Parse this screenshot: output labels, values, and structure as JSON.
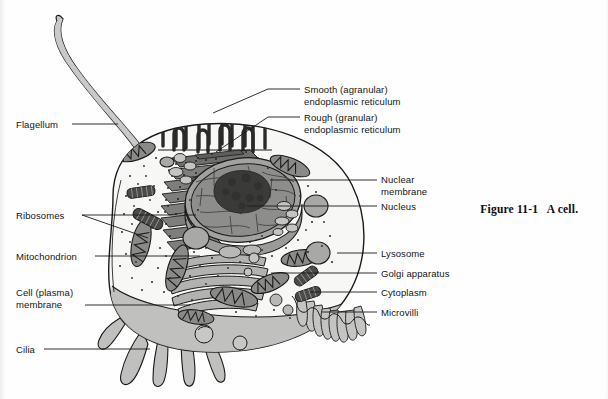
{
  "figure": {
    "number": "Figure 11-1",
    "title": "A cell.",
    "caption_x": 468,
    "caption_y": 191
  },
  "colors": {
    "outline": "#1a1a1a",
    "cytoplasm_fill": "#f7f7f5",
    "membrane_shadow": "#b9b9b7",
    "organelle_mid": "#9a9a98",
    "organelle_dark": "#5e5e5c",
    "nucleolus": "#3b3b3a",
    "nucleus_fill": "#8e8e8c",
    "page_background": "#fefefe"
  },
  "labels": [
    {
      "id": "flagellum",
      "name": "Flagellum",
      "lines": [
        "Flagellum"
      ],
      "side": "left",
      "text_x": 16,
      "text_y": 119,
      "leader": [
        [
          72,
          124
        ],
        [
          118,
          124
        ]
      ]
    },
    {
      "id": "ribosomes",
      "name": "Ribosomes",
      "lines": [
        "Ribosomes"
      ],
      "side": "left",
      "text_x": 16,
      "text_y": 210,
      "leader": [
        [
          82,
          215
        ],
        [
          196,
          215
        ]
      ],
      "leader2": [
        [
          82,
          215
        ],
        [
          148,
          238
        ]
      ]
    },
    {
      "id": "mitochondrion",
      "name": "Mitochondrion",
      "lines": [
        "Mitochondrion"
      ],
      "side": "left",
      "text_x": 16,
      "text_y": 251,
      "leader": [
        [
          95,
          256
        ],
        [
          200,
          256
        ]
      ]
    },
    {
      "id": "cell-plasma-membrane",
      "name": "Cell (plasma) membrane",
      "lines": [
        "Cell (plasma)",
        "membrane"
      ],
      "side": "left",
      "text_x": 16,
      "text_y": 287,
      "leader": [
        [
          85,
          305
        ],
        [
          190,
          305
        ]
      ]
    },
    {
      "id": "cilia",
      "name": "Cilia",
      "lines": [
        "Cilia"
      ],
      "side": "left",
      "text_x": 16,
      "text_y": 344,
      "leader": [
        [
          44,
          349
        ],
        [
          150,
          349
        ]
      ]
    },
    {
      "id": "smooth-er",
      "name": "Smooth (agranular) endoplasmic reticulum",
      "lines": [
        "Smooth (agranular)",
        "endoplasmic reticulum"
      ],
      "side": "right",
      "text_x": 304,
      "text_y": 84,
      "leader": [
        [
          268,
          89
        ],
        [
          300,
          89
        ]
      ],
      "leader2": [
        [
          268,
          89
        ],
        [
          213,
          113
        ]
      ]
    },
    {
      "id": "rough-er",
      "name": "Rough (granular) endoplasmic reticulum",
      "lines": [
        "Rough (granular)",
        "endoplasmic reticulum"
      ],
      "side": "right",
      "text_x": 304,
      "text_y": 112,
      "leader": [
        [
          268,
          117
        ],
        [
          300,
          117
        ]
      ],
      "leader2": [
        [
          268,
          117
        ],
        [
          216,
          152
        ]
      ]
    },
    {
      "id": "nuclear-membrane",
      "name": "Nuclear membrane",
      "lines": [
        "Nuclear",
        "membrane"
      ],
      "side": "right",
      "text_x": 381,
      "text_y": 174,
      "leader": [
        [
          343,
          180
        ],
        [
          377,
          180
        ]
      ],
      "leader2": [
        [
          343,
          180
        ],
        [
          270,
          180
        ]
      ]
    },
    {
      "id": "nucleus",
      "name": "Nucleus",
      "lines": [
        "Nucleus"
      ],
      "side": "right",
      "text_x": 381,
      "text_y": 201,
      "leader": [
        [
          347,
          206
        ],
        [
          377,
          206
        ]
      ],
      "leader2": [
        [
          347,
          206
        ],
        [
          247,
          206
        ]
      ]
    },
    {
      "id": "lysosome",
      "name": "Lysosome",
      "lines": [
        "Lysosome"
      ],
      "side": "right",
      "text_x": 381,
      "text_y": 248,
      "leader": [
        [
          337,
          253
        ],
        [
          377,
          253
        ]
      ]
    },
    {
      "id": "golgi-apparatus",
      "name": "Golgi apparatus",
      "lines": [
        "Golgi apparatus"
      ],
      "side": "right",
      "text_x": 381,
      "text_y": 268,
      "leader": [
        [
          271,
          273
        ],
        [
          377,
          273
        ]
      ]
    },
    {
      "id": "cytoplasm",
      "name": "Cytoplasm",
      "lines": [
        "Cytoplasm"
      ],
      "side": "right",
      "text_x": 381,
      "text_y": 287,
      "leader": [
        [
          310,
          292
        ],
        [
          377,
          292
        ]
      ]
    },
    {
      "id": "microvilli",
      "name": "Microvilli",
      "lines": [
        "Microvilli"
      ],
      "side": "right",
      "text_x": 381,
      "text_y": 307,
      "leader": [
        [
          322,
          312
        ],
        [
          377,
          312
        ]
      ]
    }
  ],
  "structures": {
    "flagellum": "single long whip-like tail extending from upper-left of cell",
    "cilia": "five short finger-like projections on lower-left membrane",
    "microvilli": "row of small finger-like projections on lower-right membrane",
    "nucleus": "large central oval with chromatin network and dark round nucleolus",
    "rough_er": "stacked flattened membranous sheets left of nucleus",
    "smooth_er": "looping tubular network at top of cell",
    "golgi": "stack of curved flattened sacs below nucleus",
    "mitochondria_count": 8,
    "lysosome_count": 4,
    "centriole_count": 4,
    "ribosomes": "scattered fine dark dots throughout cytoplasm"
  }
}
